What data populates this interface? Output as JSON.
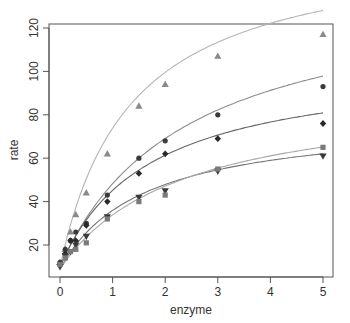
{
  "chart_data": {
    "type": "scatter",
    "title": "",
    "xlabel": "enzyme",
    "ylabel": "rate",
    "xlim": [
      -0.18,
      5.2
    ],
    "ylim": [
      6,
      122
    ],
    "xticks": [
      0,
      1,
      2,
      3,
      4,
      5
    ],
    "yticks": [
      20,
      40,
      60,
      80,
      100,
      120
    ],
    "grid": false,
    "legend": null,
    "x": [
      0,
      0.1,
      0.2,
      0.3,
      0.5,
      0.9,
      1.5,
      2,
      3,
      5
    ],
    "series": [
      {
        "name": "triangle",
        "marker": "triangle-up",
        "color": "#8a8a8a",
        "line_color": "#b4b4b4",
        "values": [
          12,
          18,
          26,
          34,
          44,
          62,
          84,
          94,
          107,
          117
        ],
        "fit": {
          "vmax": 150,
          "km": 1.35,
          "base": 10
        }
      },
      {
        "name": "circle",
        "marker": "circle",
        "color": "#3a3a3a",
        "line_color": "#8c8c8c",
        "values": [
          12,
          18,
          22,
          26,
          30,
          43,
          60,
          68,
          80,
          93
        ],
        "fit": {
          "vmax": 130,
          "km": 2.4,
          "base": 10
        }
      },
      {
        "name": "diamond",
        "marker": "diamond",
        "color": "#2a2a2a",
        "line_color": "#666666",
        "values": [
          11,
          16,
          22,
          22,
          29,
          40,
          53,
          62,
          69,
          76
        ],
        "fit": {
          "vmax": 95,
          "km": 1.7,
          "base": 10
        }
      },
      {
        "name": "inverted-triangle",
        "marker": "triangle-down",
        "color": "#3a3a3a",
        "line_color": "#777777",
        "values": [
          10,
          15,
          17,
          20,
          24,
          33,
          42,
          45,
          54,
          61
        ],
        "fit": {
          "vmax": 70,
          "km": 1.6,
          "base": 9
        }
      },
      {
        "name": "square",
        "marker": "square",
        "color": "#7a7a7a",
        "line_color": "#a8a8a8",
        "values": [
          11,
          14,
          17,
          18,
          21,
          32,
          40,
          43,
          55,
          65
        ],
        "fit": {
          "vmax": 82,
          "km": 2.3,
          "base": 9
        }
      }
    ]
  }
}
